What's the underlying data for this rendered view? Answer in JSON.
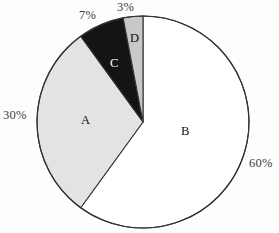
{
  "chart_data": {
    "type": "pie",
    "title": "",
    "categories": [
      "A",
      "B",
      "C",
      "D"
    ],
    "values": [
      30,
      60,
      7,
      3
    ],
    "value_labels": [
      "30%",
      "60%",
      "7%",
      "3%"
    ],
    "slice_labels": [
      "A",
      "B",
      "C",
      "D"
    ],
    "units": "percent",
    "start_angle_deg": 0,
    "direction": "clockwise",
    "legend": "none",
    "grid": false,
    "slices": [
      {
        "name": "B",
        "label": "B",
        "value": 60,
        "value_label": "60%",
        "color": "#ffffff",
        "stroke": "#333333",
        "start_deg": 0,
        "end_deg": 216
      },
      {
        "name": "A",
        "label": "A",
        "value": 30,
        "value_label": "30%",
        "color": "#e3e3e3",
        "stroke": "#333333",
        "start_deg": 216,
        "end_deg": 324
      },
      {
        "name": "C",
        "label": "C",
        "value": 7,
        "value_label": "7%",
        "color": "#141414",
        "stroke": "#333333",
        "start_deg": 324,
        "end_deg": 349.2
      },
      {
        "name": "D",
        "label": "D",
        "value": 3,
        "value_label": "3%",
        "color": "#c8c8c8",
        "stroke": "#333333",
        "start_deg": 349.2,
        "end_deg": 360
      }
    ]
  },
  "geometry": {
    "center_x": 143,
    "center_y": 122,
    "radius": 106
  },
  "colors": {
    "background": "#fdfdfd",
    "outline": "#333333",
    "label_text": "#3a3a3a",
    "slice_a_fill": "#e3e3e3",
    "slice_b_fill": "#ffffff",
    "slice_c_fill": "#141414",
    "slice_d_fill": "#c8c8c8"
  }
}
